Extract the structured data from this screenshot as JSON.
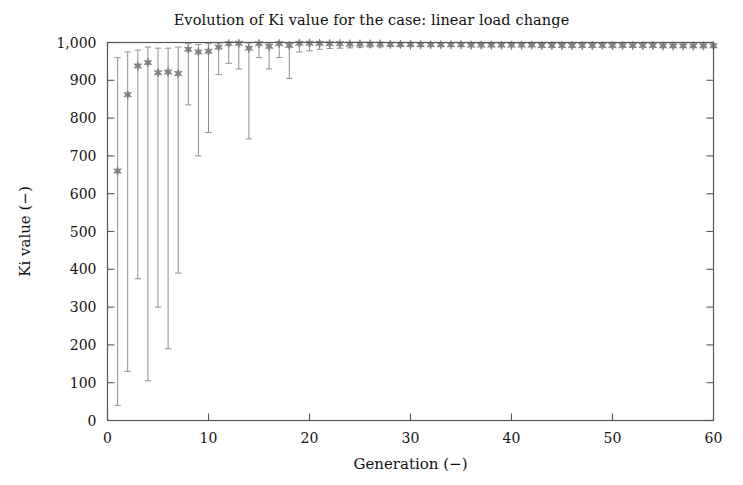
{
  "chart_data": {
    "type": "scatter",
    "title": "Evolution of Ki value for the case: linear load change",
    "xlabel": "Generation (−)",
    "ylabel": "Ki value (−)",
    "xlim": [
      0,
      60
    ],
    "ylim": [
      0,
      1000
    ],
    "xticks": [
      0,
      10,
      20,
      30,
      40,
      50,
      60
    ],
    "xtick_labels": [
      "0",
      "10",
      "20",
      "30",
      "40",
      "50",
      "60"
    ],
    "yticks": [
      0,
      100,
      200,
      300,
      400,
      500,
      600,
      700,
      800,
      900,
      1000
    ],
    "ytick_labels": [
      "0",
      "100",
      "200",
      "300",
      "400",
      "500",
      "600",
      "700",
      "800",
      "900",
      "1,000"
    ],
    "grid": false,
    "legend": null,
    "marker": "six-pointed-star",
    "marker_color": "#808080",
    "errorbar_color": "#909090",
    "series": [
      {
        "name": "Ki value",
        "x": [
          1,
          2,
          3,
          4,
          5,
          6,
          7,
          8,
          9,
          10,
          11,
          12,
          13,
          14,
          15,
          16,
          17,
          18,
          19,
          20,
          21,
          22,
          23,
          24,
          25,
          26,
          27,
          28,
          29,
          30,
          31,
          32,
          33,
          34,
          35,
          36,
          37,
          38,
          39,
          40,
          41,
          42,
          43,
          44,
          45,
          46,
          47,
          48,
          49,
          50,
          51,
          52,
          53,
          54,
          55,
          56,
          57,
          58,
          59,
          60
        ],
        "values": [
          660,
          862,
          938,
          947,
          920,
          922,
          918,
          982,
          975,
          977,
          988,
          997,
          998,
          985,
          997,
          990,
          997,
          992,
          998,
          998,
          998,
          997,
          997,
          996,
          996,
          996,
          996,
          995,
          995,
          995,
          994,
          994,
          994,
          994,
          994,
          993,
          993,
          993,
          993,
          993,
          993,
          993,
          992,
          992,
          992,
          992,
          992,
          992,
          992,
          992,
          992,
          992,
          992,
          992,
          991,
          991,
          991,
          991,
          991,
          991
        ],
        "err_low": [
          40,
          130,
          375,
          105,
          300,
          190,
          390,
          835,
          700,
          762,
          915,
          945,
          930,
          745,
          960,
          930,
          960,
          905,
          975,
          978,
          982,
          984,
          985,
          986,
          987,
          988,
          988,
          989,
          989,
          989,
          990,
          990,
          990,
          990,
          990,
          990,
          990,
          990,
          990,
          990,
          990,
          990,
          989,
          989,
          989,
          989,
          989,
          989,
          989,
          989,
          989,
          989,
          989,
          989,
          988,
          988,
          988,
          988,
          988,
          988
        ],
        "err_high": [
          960,
          975,
          980,
          988,
          985,
          985,
          988,
          997,
          995,
          997,
          999,
          1000,
          1000,
          999,
          1000,
          999,
          1000,
          1000,
          1000,
          1000,
          1000,
          1000,
          1000,
          1000,
          1000,
          999,
          999,
          999,
          999,
          999,
          999,
          999,
          998,
          998,
          998,
          998,
          998,
          998,
          998,
          998,
          998,
          997,
          997,
          997,
          997,
          997,
          997,
          997,
          997,
          997,
          996,
          996,
          996,
          996,
          996,
          996,
          996,
          996,
          996,
          996
        ]
      }
    ]
  }
}
